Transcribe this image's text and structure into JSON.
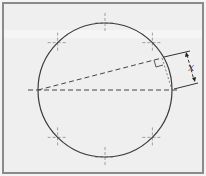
{
  "diagram": {
    "title": "",
    "dimension_label": "x",
    "colors": {
      "background": "#efefef",
      "border": "#8a8a8a",
      "circle": "#3a3a3a",
      "dashed": "#444444",
      "tick": "#8c8c8c"
    },
    "elements": {
      "circle": "circle with 8 cross-tick markers",
      "diameter": "horizontal dashed diameter",
      "chord": "dashed chord from left end of diameter",
      "right_angle": "right-angle marker at chord end",
      "dimension": "dimension arrow labeled x between chord end and diameter end"
    }
  }
}
